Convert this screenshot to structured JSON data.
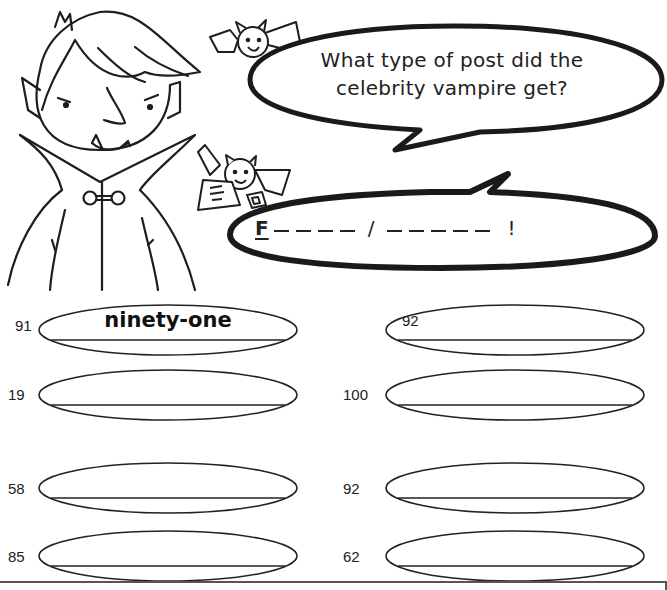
{
  "worksheet": {
    "riddle": {
      "question_line1": "What type of post did the",
      "question_line2": "celebrity vampire get?",
      "answer": {
        "first_letter": "F",
        "word1_blanks": 4,
        "separator": "/",
        "word2_blanks": 5,
        "ending": "!"
      }
    },
    "characters": {
      "main": "vampire-icon",
      "bat1": "bat-icon",
      "bat2": "bat-with-letter-icon"
    },
    "exercises": [
      {
        "id": "ex1",
        "number": "91",
        "answer": "ninety-one",
        "label_position": "outside"
      },
      {
        "id": "ex2",
        "number": "92",
        "answer": "",
        "label_position": "inside"
      },
      {
        "id": "ex3",
        "number": "19",
        "answer": "",
        "label_position": "outside"
      },
      {
        "id": "ex4",
        "number": "100",
        "answer": "",
        "label_position": "outside"
      },
      {
        "id": "ex5",
        "number": "58",
        "answer": "",
        "label_position": "outside"
      },
      {
        "id": "ex6",
        "number": "92",
        "answer": "",
        "label_position": "outside"
      },
      {
        "id": "ex7",
        "number": "85",
        "answer": "",
        "label_position": "outside"
      },
      {
        "id": "ex8",
        "number": "62",
        "answer": "",
        "label_position": "outside"
      }
    ],
    "colors": {
      "ink": "#1e1e1e",
      "paper": "#ffffff",
      "rule": "#555555"
    }
  }
}
